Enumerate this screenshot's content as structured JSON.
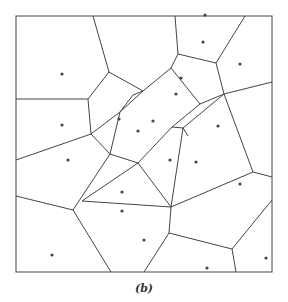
{
  "figure": {
    "caption": "(b)",
    "type": "voronoi-diagram",
    "line_color": "#444444",
    "dot_color": "#444444",
    "background": "#ffffff",
    "box": {
      "x": 16,
      "y": 16,
      "w": 256,
      "h": 256
    }
  },
  "edges": [
    [
      93,
      16,
      109,
      72
    ],
    [
      16,
      99,
      88,
      99
    ],
    [
      88,
      99,
      109,
      72
    ],
    [
      109,
      72,
      143,
      91
    ],
    [
      175,
      16,
      178,
      54
    ],
    [
      178,
      54,
      171,
      68
    ],
    [
      178,
      54,
      216,
      63
    ],
    [
      216,
      63,
      245,
      16
    ],
    [
      216,
      63,
      224,
      94
    ],
    [
      224,
      94,
      272,
      82
    ],
    [
      171,
      68,
      143,
      91
    ],
    [
      171,
      68,
      200,
      104
    ],
    [
      200,
      104,
      224,
      94
    ],
    [
      143,
      91,
      133,
      95
    ],
    [
      133,
      95,
      120,
      112
    ],
    [
      120,
      112,
      91,
      134
    ],
    [
      88,
      99,
      91,
      134
    ],
    [
      91,
      134,
      16,
      160
    ],
    [
      91,
      134,
      110,
      154
    ],
    [
      110,
      154,
      120,
      112
    ],
    [
      120,
      112,
      143,
      91
    ],
    [
      200,
      104,
      172,
      127
    ],
    [
      172,
      127,
      183,
      128
    ],
    [
      183,
      128,
      224,
      94
    ],
    [
      224,
      94,
      253,
      172
    ],
    [
      172,
      127,
      138,
      163
    ],
    [
      183,
      128,
      171,
      207
    ],
    [
      183,
      128,
      188,
      136
    ],
    [
      110,
      154,
      138,
      163
    ],
    [
      138,
      163,
      82,
      201
    ],
    [
      110,
      154,
      73,
      210
    ],
    [
      73,
      210,
      16,
      196
    ],
    [
      73,
      210,
      111,
      272
    ],
    [
      82,
      201,
      171,
      207
    ],
    [
      171,
      207,
      253,
      172
    ],
    [
      253,
      172,
      272,
      177
    ],
    [
      171,
      207,
      169,
      233
    ],
    [
      169,
      233,
      144,
      272
    ],
    [
      169,
      233,
      232,
      249
    ],
    [
      232,
      249,
      272,
      200
    ],
    [
      232,
      249,
      236,
      272
    ],
    [
      138,
      163,
      171,
      207
    ]
  ],
  "sites": [
    [
      62,
      74
    ],
    [
      62,
      125
    ],
    [
      119,
      119
    ],
    [
      138,
      131
    ],
    [
      205,
      15
    ],
    [
      203,
      42
    ],
    [
      240,
      64
    ],
    [
      176,
      94
    ],
    [
      181,
      78
    ],
    [
      153,
      121
    ],
    [
      218,
      126
    ],
    [
      68,
      160
    ],
    [
      122,
      192
    ],
    [
      122,
      211
    ],
    [
      196,
      162
    ],
    [
      240,
      184
    ],
    [
      52,
      255
    ],
    [
      207,
      268
    ],
    [
      266,
      258
    ],
    [
      170,
      160
    ],
    [
      144,
      240
    ]
  ]
}
